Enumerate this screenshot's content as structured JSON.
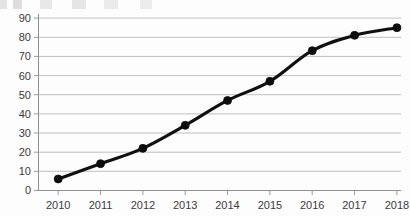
{
  "figure": {
    "background_color": "#fdfdfd",
    "line_color": "#101010",
    "grid_color": "#b9b9bd",
    "axis_color": "#8f8f94",
    "text_color": "#3b3b3b"
  },
  "chart_data": {
    "type": "line",
    "title": "",
    "subtitle": "",
    "xlabel": "",
    "ylabel": "",
    "categories": [
      "2010",
      "2011",
      "2012",
      "2013",
      "2014",
      "2015",
      "2016",
      "2017",
      "2018"
    ],
    "x": [
      2010,
      2011,
      2012,
      2013,
      2014,
      2015,
      2016,
      2017,
      2018
    ],
    "values": [
      6,
      14,
      22,
      34,
      47,
      57,
      73,
      81,
      85
    ],
    "series": [
      {
        "name": "",
        "values": [
          6,
          14,
          22,
          34,
          47,
          57,
          73,
          81,
          85
        ],
        "color": "#101010",
        "marker": "circle",
        "marker_size": 4
      }
    ],
    "ylim": [
      0,
      90
    ],
    "yticks": [
      0,
      10,
      20,
      30,
      40,
      50,
      60,
      70,
      80,
      90
    ],
    "ytick_labels": [
      "0",
      "10",
      "20",
      "30",
      "40",
      "50",
      "60",
      "70",
      "80",
      "90"
    ],
    "xtick_labels": [
      "2010",
      "2011",
      "2012",
      "2013",
      "2014",
      "2015",
      "2016",
      "2017",
      "2018"
    ],
    "grid": true,
    "grid_axis": "y",
    "legend": false,
    "legend_position": "none"
  }
}
